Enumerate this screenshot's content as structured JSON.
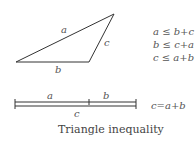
{
  "diagram": {
    "triangle": {
      "vertices": [
        [
          16,
          62
        ],
        [
          89,
          62
        ],
        [
          114,
          14
        ]
      ],
      "labels": {
        "a": "a",
        "b": "b",
        "c": "c"
      }
    },
    "inequalities": [
      "a ≤ b+c",
      "b ≤ c+a",
      "c ≤ a+b"
    ],
    "segments": {
      "label_a": "a",
      "label_b": "b",
      "label_c": "c",
      "equation": "c=a+b"
    },
    "caption": "Triangle inequality",
    "colors": {
      "stroke": "#333333",
      "text": "#555555"
    }
  }
}
